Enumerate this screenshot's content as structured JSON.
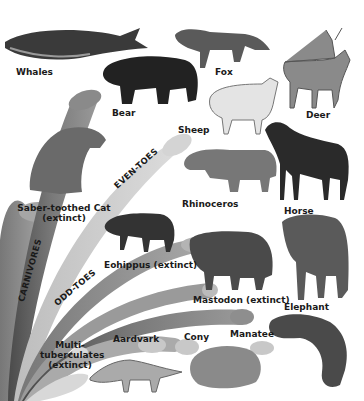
{
  "diagram": {
    "groups": [
      {
        "id": "carnivores",
        "label": "CARNIVORES"
      },
      {
        "id": "even_toes",
        "label": "EVEN-TOES"
      },
      {
        "id": "odd_toes",
        "label": "ODD-TOES"
      }
    ],
    "animals": [
      {
        "id": "whales",
        "label": "Whales"
      },
      {
        "id": "fox",
        "label": "Fox"
      },
      {
        "id": "deer",
        "label": "Deer"
      },
      {
        "id": "bear",
        "label": "Bear"
      },
      {
        "id": "sheep",
        "label": "Sheep"
      },
      {
        "id": "saber_cat",
        "label": "Saber-toothed Cat",
        "note": "(extinct)"
      },
      {
        "id": "rhinoceros",
        "label": "Rhinoceros"
      },
      {
        "id": "horse",
        "label": "Horse"
      },
      {
        "id": "eohippus",
        "label": "Eohippus (extinct)"
      },
      {
        "id": "mastodon",
        "label": "Mastodon (extinct)"
      },
      {
        "id": "elephant",
        "label": "Elephant"
      },
      {
        "id": "aardvark",
        "label": "Aardvark"
      },
      {
        "id": "cony",
        "label": "Cony"
      },
      {
        "id": "manatee",
        "label": "Manatee"
      },
      {
        "id": "multituberculates",
        "label_lines": [
          "Multi-",
          "tuberculates",
          "(extinct)"
        ]
      }
    ],
    "colors": {
      "background": "#ffffff",
      "branch_dark": "#5f5f5f",
      "branch_mid": "#8c8c8c",
      "branch_light": "#c4c4c4",
      "branch_pale": "#dedede",
      "text": "#1a1a1a"
    }
  }
}
